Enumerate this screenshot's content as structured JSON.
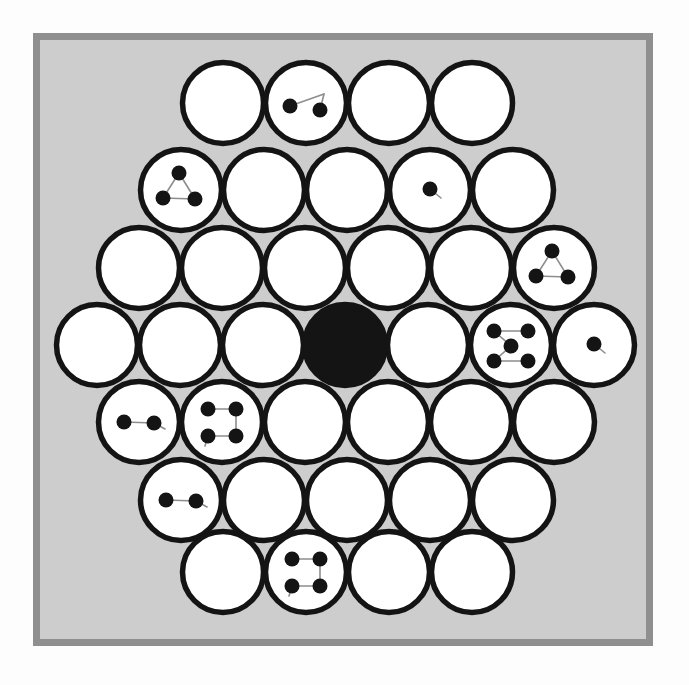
{
  "scene": {
    "title": "Hexagonal circle packing board",
    "canvas_width": 689,
    "canvas_height": 685,
    "page_background": "#fdfdfd"
  },
  "frame": {
    "name": "board-frame",
    "x": 33,
    "y": 33,
    "width": 620,
    "height": 613,
    "border_width": 7,
    "border_color": "#8f8f8f",
    "fill_color": "#cdcdcd"
  },
  "style": {
    "circle_fill": "#ffffff",
    "circle_stroke": "#141414",
    "circle_stroke_width": 5.5,
    "circle_radius": 40.5,
    "dot_fill": "#141414",
    "dot_radius": 7.5,
    "link_color": "#8d8d8d",
    "link_width": 1.6,
    "filled_circle_fill": "#141414"
  },
  "grid": {
    "rows": 7,
    "row_counts": [
      4,
      5,
      6,
      7,
      6,
      5,
      4
    ],
    "spacing_x": 83,
    "spacing_y": 76,
    "center_x": 345,
    "center_y": 345,
    "total_circles": 37
  },
  "circles": [
    {
      "id": "r1c1",
      "row": 1,
      "col": 1,
      "cx": 223,
      "cy": 103,
      "state": "empty",
      "dots": 0,
      "pattern": "none"
    },
    {
      "id": "r1c2",
      "row": 1,
      "col": 2,
      "cx": 306,
      "cy": 103,
      "state": "marked",
      "dots": 2,
      "pattern": "pair-diagonal"
    },
    {
      "id": "r1c3",
      "row": 1,
      "col": 3,
      "cx": 389,
      "cy": 103,
      "state": "empty",
      "dots": 0,
      "pattern": "none"
    },
    {
      "id": "r1c4",
      "row": 1,
      "col": 4,
      "cx": 472,
      "cy": 103,
      "state": "empty",
      "dots": 0,
      "pattern": "none"
    },
    {
      "id": "r2c1",
      "row": 2,
      "col": 1,
      "cx": 181,
      "cy": 190,
      "state": "marked",
      "dots": 3,
      "pattern": "triangle"
    },
    {
      "id": "r2c2",
      "row": 2,
      "col": 2,
      "cx": 264,
      "cy": 190,
      "state": "empty",
      "dots": 0,
      "pattern": "none"
    },
    {
      "id": "r2c3",
      "row": 2,
      "col": 3,
      "cx": 347,
      "cy": 190,
      "state": "empty",
      "dots": 0,
      "pattern": "none"
    },
    {
      "id": "r2c4",
      "row": 2,
      "col": 4,
      "cx": 430,
      "cy": 190,
      "state": "marked",
      "dots": 1,
      "pattern": "single"
    },
    {
      "id": "r2c5",
      "row": 2,
      "col": 5,
      "cx": 513,
      "cy": 190,
      "state": "empty",
      "dots": 0,
      "pattern": "none"
    },
    {
      "id": "r3c1",
      "row": 3,
      "col": 1,
      "cx": 139,
      "cy": 268,
      "state": "empty",
      "dots": 0,
      "pattern": "none"
    },
    {
      "id": "r3c2",
      "row": 3,
      "col": 2,
      "cx": 222,
      "cy": 268,
      "state": "empty",
      "dots": 0,
      "pattern": "none"
    },
    {
      "id": "r3c3",
      "row": 3,
      "col": 3,
      "cx": 305,
      "cy": 268,
      "state": "empty",
      "dots": 0,
      "pattern": "none"
    },
    {
      "id": "r3c4",
      "row": 3,
      "col": 4,
      "cx": 388,
      "cy": 268,
      "state": "empty",
      "dots": 0,
      "pattern": "none"
    },
    {
      "id": "r3c5",
      "row": 3,
      "col": 5,
      "cx": 471,
      "cy": 268,
      "state": "empty",
      "dots": 0,
      "pattern": "none"
    },
    {
      "id": "r3c6",
      "row": 3,
      "col": 6,
      "cx": 554,
      "cy": 268,
      "state": "marked",
      "dots": 3,
      "pattern": "triangle"
    },
    {
      "id": "r4c1",
      "row": 4,
      "col": 1,
      "cx": 97,
      "cy": 345,
      "state": "empty",
      "dots": 0,
      "pattern": "none"
    },
    {
      "id": "r4c2",
      "row": 4,
      "col": 2,
      "cx": 180,
      "cy": 345,
      "state": "empty",
      "dots": 0,
      "pattern": "none"
    },
    {
      "id": "r4c3",
      "row": 4,
      "col": 3,
      "cx": 263,
      "cy": 345,
      "state": "empty",
      "dots": 0,
      "pattern": "none"
    },
    {
      "id": "r4c4",
      "row": 4,
      "col": 4,
      "cx": 345,
      "cy": 345,
      "state": "filled",
      "dots": 0,
      "pattern": "none"
    },
    {
      "id": "r4c5",
      "row": 4,
      "col": 5,
      "cx": 428,
      "cy": 345,
      "state": "empty",
      "dots": 0,
      "pattern": "none"
    },
    {
      "id": "r4c6",
      "row": 4,
      "col": 6,
      "cx": 511,
      "cy": 345,
      "state": "marked",
      "dots": 5,
      "pattern": "quincunx"
    },
    {
      "id": "r4c7",
      "row": 4,
      "col": 7,
      "cx": 594,
      "cy": 345,
      "state": "marked",
      "dots": 1,
      "pattern": "single"
    },
    {
      "id": "r5c1",
      "row": 5,
      "col": 1,
      "cx": 139,
      "cy": 422,
      "state": "marked",
      "dots": 2,
      "pattern": "pair-horizontal"
    },
    {
      "id": "r5c2",
      "row": 5,
      "col": 2,
      "cx": 222,
      "cy": 422,
      "state": "marked",
      "dots": 4,
      "pattern": "square"
    },
    {
      "id": "r5c3",
      "row": 5,
      "col": 3,
      "cx": 305,
      "cy": 422,
      "state": "empty",
      "dots": 0,
      "pattern": "none"
    },
    {
      "id": "r5c4",
      "row": 5,
      "col": 4,
      "cx": 388,
      "cy": 422,
      "state": "empty",
      "dots": 0,
      "pattern": "none"
    },
    {
      "id": "r5c5",
      "row": 5,
      "col": 5,
      "cx": 471,
      "cy": 422,
      "state": "empty",
      "dots": 0,
      "pattern": "none"
    },
    {
      "id": "r5c6",
      "row": 5,
      "col": 6,
      "cx": 554,
      "cy": 422,
      "state": "empty",
      "dots": 0,
      "pattern": "none"
    },
    {
      "id": "r6c1",
      "row": 6,
      "col": 1,
      "cx": 181,
      "cy": 500,
      "state": "marked",
      "dots": 2,
      "pattern": "pair-horizontal"
    },
    {
      "id": "r6c2",
      "row": 6,
      "col": 2,
      "cx": 264,
      "cy": 500,
      "state": "empty",
      "dots": 0,
      "pattern": "none"
    },
    {
      "id": "r6c3",
      "row": 6,
      "col": 3,
      "cx": 347,
      "cy": 500,
      "state": "empty",
      "dots": 0,
      "pattern": "none"
    },
    {
      "id": "r6c4",
      "row": 6,
      "col": 4,
      "cx": 430,
      "cy": 500,
      "state": "empty",
      "dots": 0,
      "pattern": "none"
    },
    {
      "id": "r6c5",
      "row": 6,
      "col": 5,
      "cx": 513,
      "cy": 500,
      "state": "empty",
      "dots": 0,
      "pattern": "none"
    },
    {
      "id": "r7c1",
      "row": 7,
      "col": 1,
      "cx": 223,
      "cy": 572,
      "state": "empty",
      "dots": 0,
      "pattern": "none"
    },
    {
      "id": "r7c2",
      "row": 7,
      "col": 2,
      "cx": 306,
      "cy": 572,
      "state": "marked",
      "dots": 4,
      "pattern": "square"
    },
    {
      "id": "r7c3",
      "row": 7,
      "col": 3,
      "cx": 389,
      "cy": 572,
      "state": "empty",
      "dots": 0,
      "pattern": "none"
    },
    {
      "id": "r7c4",
      "row": 7,
      "col": 4,
      "cx": 472,
      "cy": 572,
      "state": "empty",
      "dots": 0,
      "pattern": "none"
    }
  ],
  "dot_patterns": {
    "none": {
      "dots": [],
      "links": []
    },
    "single": {
      "dots": [
        [
          0,
          -1
        ]
      ],
      "links": [
        [
          0,
          -1,
          11,
          8
        ]
      ]
    },
    "pair-horizontal": {
      "dots": [
        [
          -15,
          0
        ],
        [
          15,
          1
        ]
      ],
      "links": [
        [
          -15,
          0,
          15,
          1
        ],
        [
          15,
          1,
          26,
          7
        ]
      ]
    },
    "pair-diagonal": {
      "dots": [
        [
          -16,
          3
        ],
        [
          14,
          7
        ]
      ],
      "links": [
        [
          -16,
          3,
          18,
          -9
        ],
        [
          18,
          -9,
          14,
          7
        ]
      ]
    },
    "triangle": {
      "dots": [
        [
          -2,
          -17
        ],
        [
          -18,
          8
        ],
        [
          14,
          9
        ]
      ],
      "links": [
        [
          -2,
          -17,
          -18,
          8
        ],
        [
          -18,
          8,
          14,
          9
        ],
        [
          14,
          9,
          -2,
          -17
        ]
      ]
    },
    "square": {
      "dots": [
        [
          -14,
          -13
        ],
        [
          14,
          -13
        ],
        [
          -14,
          14
        ],
        [
          14,
          14
        ]
      ],
      "links": [
        [
          -14,
          -13,
          14,
          -13
        ],
        [
          14,
          -13,
          14,
          14
        ],
        [
          14,
          14,
          -14,
          14
        ],
        [
          -14,
          14,
          -17,
          24
        ]
      ]
    },
    "quincunx": {
      "dots": [
        [
          -17,
          -14
        ],
        [
          17,
          -14
        ],
        [
          0,
          1
        ],
        [
          -17,
          16
        ],
        [
          17,
          16
        ]
      ],
      "links": [
        [
          -17,
          -14,
          17,
          -14
        ],
        [
          -17,
          -14,
          0,
          1
        ],
        [
          0,
          1,
          -17,
          16
        ],
        [
          -17,
          16,
          17,
          16
        ]
      ]
    }
  },
  "legend": {
    "filled_label": "filled",
    "empty_label": "empty",
    "marked_label": "marked"
  }
}
